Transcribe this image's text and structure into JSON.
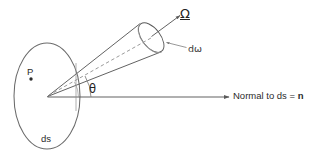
{
  "figure": {
    "background_color": "#ffffff",
    "stroke_color": "#5a5a5a",
    "text_color": "#2b2b2b",
    "width": 322,
    "height": 161,
    "labels": {
      "omega": "Ω",
      "d_omega": "dω",
      "theta": "θ",
      "point_p": "P",
      "surface_ds": "ds",
      "normal_prefix": "Normal to ds = ",
      "normal_vector": "n",
      "normal_full": "Normal to ds = n"
    },
    "geometry": {
      "surface_ellipse": {
        "cx": 47,
        "cy": 96,
        "rx": 33,
        "ry": 53
      },
      "point_p_marker": {
        "cx": 31,
        "cy": 79,
        "r": 1.6
      },
      "cone_apex": {
        "x": 47,
        "y": 97
      },
      "cone_cap_ellipse": {
        "cx": 152,
        "cy": 38,
        "rx": 9,
        "ry": 17,
        "rotation_deg": -36
      },
      "cone_axis_dashed": {
        "x1": 48,
        "y1": 96,
        "x2": 152,
        "y2": 38
      },
      "normal_arrow": {
        "x1": 47,
        "y1": 97,
        "x2": 229,
        "y2": 97
      },
      "omega_arrow": {
        "x1": 152,
        "y1": 36,
        "x2": 181,
        "y2": 15
      },
      "domega_leader": {
        "x1": 186,
        "y1": 48,
        "x2": 166,
        "y2": 43
      },
      "theta_arc_radius": 44
    }
  }
}
